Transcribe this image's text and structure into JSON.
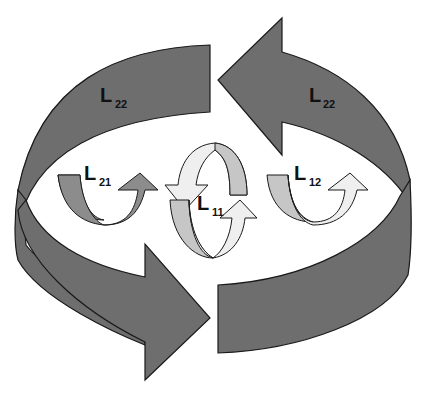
{
  "diagram": {
    "type": "feedback-loop",
    "colors": {
      "dark_fill": "#6e6e6e",
      "mid_fill": "#8c8c8c",
      "light_fill": "#c6c6c6",
      "pale_fill": "#efefef",
      "stroke": "#1a1a1a",
      "background": "#ffffff"
    },
    "outer_loop": {
      "label_main": "L",
      "label_sub": "22",
      "arrows": [
        {
          "id": "outer-top",
          "direction": "left",
          "label_main": "L",
          "label_sub": "22"
        },
        {
          "id": "outer-bottom",
          "direction": "right"
        }
      ],
      "left_band_label": {
        "main": "L",
        "sub": "22"
      }
    },
    "inner_loops": [
      {
        "id": "L21",
        "label_main": "L",
        "label_sub": "21",
        "shade": "dark"
      },
      {
        "id": "L11",
        "label_main": "L",
        "label_sub": "11",
        "shade": "light"
      },
      {
        "id": "L12",
        "label_main": "L",
        "label_sub": "12",
        "shade": "light"
      }
    ]
  }
}
